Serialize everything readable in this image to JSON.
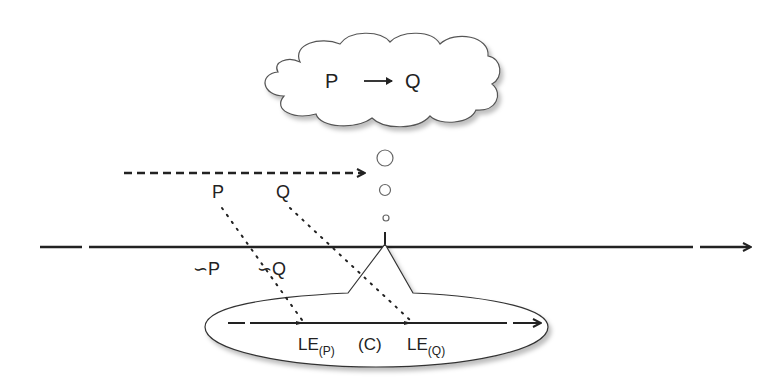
{
  "diagram": {
    "cloud": {
      "left": "P",
      "arrow": "→",
      "right": "Q"
    },
    "top_labels": {
      "p": "P",
      "q": "Q"
    },
    "negation_labels": {
      "not_p": "∽P",
      "not_q": "∽Q"
    },
    "ellipse": {
      "le_p_main": "LE",
      "le_p_sub": "(P)",
      "center": "(C)",
      "le_q_main": "LE",
      "le_q_sub": "(Q)"
    },
    "colors": {
      "stroke": "#222222",
      "background": "#ffffff"
    }
  }
}
